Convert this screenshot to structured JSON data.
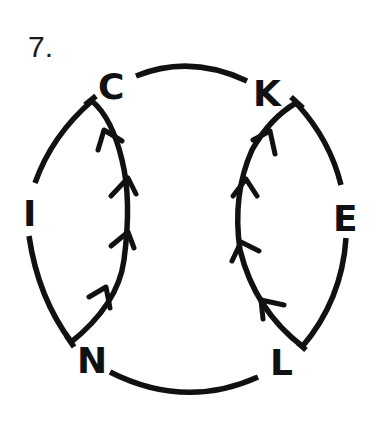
{
  "problem": {
    "number": "7."
  },
  "graph": {
    "vertices": [
      {
        "id": "C",
        "label": "C"
      },
      {
        "id": "K",
        "label": "K"
      },
      {
        "id": "E",
        "label": "E"
      },
      {
        "id": "L",
        "label": "L"
      },
      {
        "id": "N",
        "label": "N"
      },
      {
        "id": "I",
        "label": "I"
      }
    ],
    "outer_cycle": [
      "C",
      "K",
      "E",
      "L",
      "N",
      "I",
      "C"
    ],
    "directed_edges": [
      {
        "from": "N",
        "to": "C",
        "arrow_count": 4
      },
      {
        "from": "L",
        "to": "K",
        "arrow_count": 4
      }
    ],
    "stroke_color": "#111111"
  }
}
